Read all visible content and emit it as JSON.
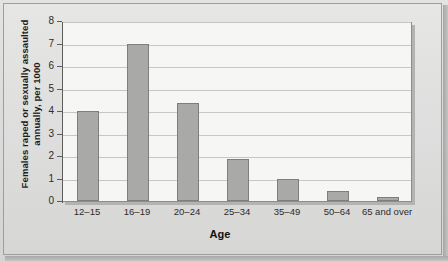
{
  "chart_data": {
    "type": "bar",
    "title": "",
    "xlabel": "Age",
    "ylabel": "Females raped or sexually assaulted annually, per 1000",
    "ylabel_lines": [
      "Females raped or sexually assaulted",
      "annually, per 1000"
    ],
    "categories": [
      "12–15",
      "16–19",
      "20–24",
      "25–34",
      "35–49",
      "50–64",
      "65 and over"
    ],
    "values": [
      4.0,
      7.0,
      4.35,
      1.85,
      1.0,
      0.45,
      0.2
    ],
    "ylim": [
      0,
      8
    ],
    "yticks": [
      0,
      1,
      2,
      3,
      4,
      5,
      6,
      7,
      8
    ],
    "ytick_labels": [
      "0",
      "1",
      "2",
      "3",
      "4",
      "5",
      "6",
      "7",
      "8"
    ],
    "grid": true,
    "legend": "none",
    "bar_color": "#a9a9a7",
    "bar_border_color": "#7e7e7c",
    "plot_background": "#f6f6f4",
    "page_background": "#dedede",
    "axis_color": "#5c5c5a",
    "gridline_color": "#c6c6c4"
  }
}
